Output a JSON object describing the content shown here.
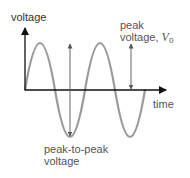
{
  "diagram": {
    "y_axis_label": "voltage",
    "x_axis_label": "time",
    "annotations": {
      "peak": {
        "line1": "peak",
        "line2_prefix": "voltage, ",
        "symbol": "V",
        "subscript": "0"
      },
      "peak_to_peak": {
        "line1": "peak-to-peak",
        "line2": "voltage"
      }
    },
    "colors": {
      "axis": "#111111",
      "wave": "#9a9a9a",
      "arrow": "#555555",
      "text": "#333333"
    }
  }
}
